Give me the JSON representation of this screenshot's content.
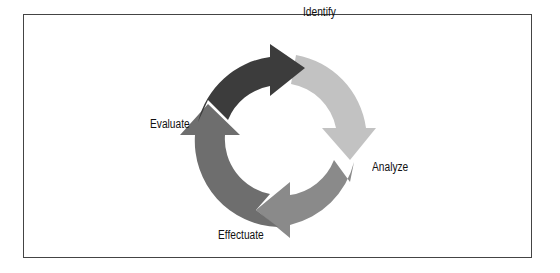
{
  "diagram": {
    "type": "cycle",
    "stages": [
      {
        "label": "Identify",
        "color": "#c2c2c2"
      },
      {
        "label": "Analyze",
        "color": "#8a8a8a"
      },
      {
        "label": "Effectuate",
        "color": "#6e6e6e"
      },
      {
        "label": "Evaluate",
        "color": "#3c3c3c"
      }
    ],
    "frame_color": "#444444"
  }
}
